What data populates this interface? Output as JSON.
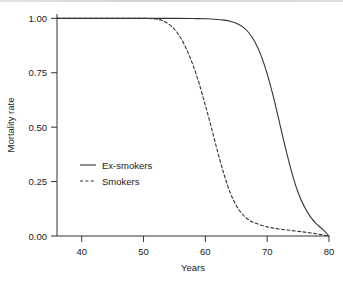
{
  "chart_data": {
    "type": "line",
    "title": "",
    "xlabel": "Years",
    "ylabel": "Mortality rate",
    "xlim": [
      36,
      80
    ],
    "ylim": [
      0.0,
      1.02
    ],
    "xticks": [
      40,
      50,
      60,
      70,
      80
    ],
    "xtick_labels": [
      "40",
      "50",
      "60",
      "70",
      "80"
    ],
    "yticks": [
      0.0,
      0.25,
      0.5,
      0.75,
      1.0
    ],
    "ytick_labels": [
      "0.00",
      "0.25",
      "0.50",
      "0.75",
      "1.00"
    ],
    "grid": false,
    "legend_position": "center-left",
    "series": [
      {
        "name": "Ex-smokers",
        "style": "solid",
        "color": "#333333",
        "x": [
          36,
          40,
          45,
          50,
          55,
          58,
          60,
          62,
          63,
          64,
          65,
          66,
          67,
          68,
          69,
          70,
          71,
          72,
          73,
          74,
          75,
          76,
          77,
          78,
          79,
          80
        ],
        "y": [
          1.0,
          1.0,
          1.0,
          1.0,
          1.0,
          0.999,
          0.998,
          0.995,
          0.992,
          0.987,
          0.978,
          0.962,
          0.935,
          0.893,
          0.83,
          0.745,
          0.64,
          0.52,
          0.4,
          0.29,
          0.2,
          0.135,
          0.088,
          0.055,
          0.03,
          0.0
        ]
      },
      {
        "name": "Smokers",
        "style": "dashed",
        "color": "#333333",
        "x": [
          36,
          40,
          45,
          50,
          52,
          53,
          54,
          55,
          56,
          57,
          58,
          59,
          60,
          61,
          62,
          63,
          64,
          65,
          66,
          67,
          68,
          70,
          72,
          74,
          76,
          78,
          80
        ],
        "y": [
          1.0,
          1.0,
          1.0,
          1.0,
          0.997,
          0.99,
          0.975,
          0.95,
          0.91,
          0.855,
          0.785,
          0.7,
          0.6,
          0.495,
          0.385,
          0.285,
          0.2,
          0.14,
          0.1,
          0.075,
          0.06,
          0.042,
          0.032,
          0.025,
          0.018,
          0.01,
          0.0
        ]
      }
    ]
  },
  "legend": {
    "entries": [
      {
        "label": "Ex-smokers",
        "style": "solid"
      },
      {
        "label": "Smokers",
        "style": "dashed"
      }
    ]
  }
}
